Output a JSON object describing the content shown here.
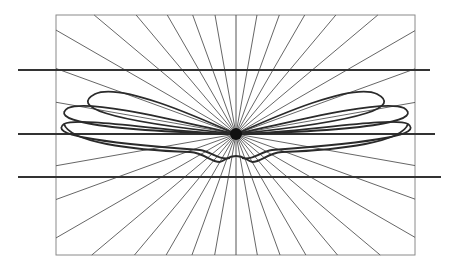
{
  "diagram": {
    "width": 457,
    "height": 268,
    "background": "#ffffff",
    "frame": {
      "x": 56,
      "y": 15,
      "w": 359,
      "h": 240,
      "stroke": "#8a8a8a",
      "stroke_width": 1
    },
    "center": {
      "x": 236,
      "y": 134,
      "dot_radius": 6,
      "fill": "#111111"
    },
    "rays": {
      "step_deg": 10,
      "stroke": "#555555",
      "stroke_width": 0.9
    },
    "horizontal_lines": [
      {
        "y": 70,
        "x1": 18,
        "x2": 430,
        "stroke": "#333333",
        "stroke_width": 2
      },
      {
        "y": 134,
        "x1": 18,
        "x2": 435,
        "stroke": "#333333",
        "stroke_width": 2
      },
      {
        "y": 177,
        "x1": 18,
        "x2": 441,
        "stroke": "#333333",
        "stroke_width": 2
      }
    ],
    "lobes": {
      "stroke": "#2a2a2a",
      "stroke_width": 1.8,
      "left": [
        "M236,134 C200,118 120,82 95,94 C72,106 100,120 236,134",
        "M236,134 C190,124 90,98 68,108 C52,118 80,130 236,134",
        "M236,134 C180,134 80,116 64,124 C50,134 90,142 200,150 C212,152 218,160 230,158"
      ],
      "right": [
        "M236,134 C272,118 352,82 377,94 C400,106 372,120 236,134",
        "M236,134 C282,124 382,98 404,108 C420,118 392,130 236,134",
        "M236,134 C292,134 392,116 408,124 C422,134 382,142 272,150 C260,152 254,160 242,158"
      ],
      "lower_envelope": "M64,124 C70,142 130,150 190,152 C205,153 210,162 220,162 C226,160 228,156 236,156 C244,156 246,160 252,162 C262,162 267,153 282,152 C342,150 402,142 408,124"
    }
  }
}
